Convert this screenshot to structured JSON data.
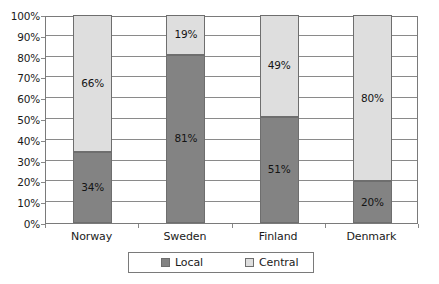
{
  "chart_data": {
    "type": "bar",
    "subtype": "stacked-percentage-column",
    "title": "",
    "subtitle": "",
    "xlabel": "",
    "ylabel": "",
    "categories": [
      "Norway",
      "Sweden",
      "Finland",
      "Denmark"
    ],
    "series": [
      {
        "name": "Local",
        "color": "#838383",
        "values": [
          34,
          81,
          51,
          20
        ],
        "labels": [
          "34%",
          "81%",
          "51%",
          "20%"
        ]
      },
      {
        "name": "Central",
        "color": "#dedede",
        "values": [
          66,
          19,
          49,
          80
        ],
        "labels": [
          "66%",
          "19%",
          "49%",
          "80%"
        ]
      }
    ],
    "ylim": [
      0,
      100
    ],
    "ytick_values": [
      0,
      10,
      20,
      30,
      40,
      50,
      60,
      70,
      80,
      90,
      100
    ],
    "ytick_labels": [
      "0%",
      "10%",
      "20%",
      "30%",
      "40%",
      "50%",
      "60%",
      "70%",
      "80%",
      "90%",
      "100%"
    ],
    "grid": true,
    "grid_axis": "y",
    "legend": true,
    "legend_position": "bottom",
    "legend_entries": [
      "Local",
      "Central"
    ],
    "value_labels_shown": true,
    "frame_color": "#7a7a7a",
    "gridline_color": "#8a8a8a",
    "background_color": "#ffffff"
  }
}
